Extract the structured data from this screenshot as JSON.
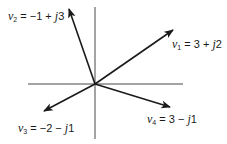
{
  "diagram": {
    "type": "phasor-diagram",
    "colors": {
      "line": "#1a1a1a",
      "background": "#ffffff"
    },
    "axes": {
      "horizontal": {
        "x1": 28,
        "y1": 84,
        "x2": 183,
        "y2": 84
      },
      "vertical": {
        "x1": 95,
        "y1": 7,
        "x2": 95,
        "y2": 139
      }
    },
    "origin": {
      "x": 95,
      "y": 84
    },
    "vectors": [
      {
        "name": "v",
        "sub": "1",
        "expr": " = 3 + ",
        "j": "j",
        "imag": "2",
        "real_value": 3,
        "imag_value": 2,
        "tip": {
          "x": 173,
          "y": 30
        },
        "label_pos": {
          "x": 172,
          "y": 38
        }
      },
      {
        "name": "v",
        "sub": "2",
        "expr": " = −1 + ",
        "j": "j",
        "imag": "3",
        "real_value": -1,
        "imag_value": 3,
        "tip": {
          "x": 69,
          "y": 9
        },
        "label_pos": {
          "x": 8,
          "y": 10
        }
      },
      {
        "name": "v",
        "sub": "3",
        "expr": " = −2 − ",
        "j": "j",
        "imag": "1",
        "real_value": -2,
        "imag_value": -1,
        "tip": {
          "x": 44,
          "y": 111
        },
        "label_pos": {
          "x": 18,
          "y": 122
        }
      },
      {
        "name": "v",
        "sub": "4",
        "expr": " = 3 − ",
        "j": "j",
        "imag": "1",
        "real_value": 3,
        "imag_value": -1,
        "tip": {
          "x": 170,
          "y": 107
        },
        "label_pos": {
          "x": 147,
          "y": 113
        }
      }
    ]
  }
}
